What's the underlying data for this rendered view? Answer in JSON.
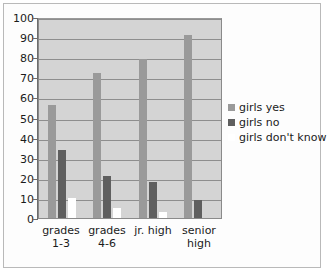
{
  "chart_data": {
    "type": "bar",
    "title": "",
    "subtitle": "",
    "xlabel": "",
    "ylabel": "",
    "categories": [
      "grades 1-3",
      "grades 4-6",
      "jr. high",
      "senior high"
    ],
    "category_lines": [
      [
        "grades",
        "1-3"
      ],
      [
        "grades",
        "4-6"
      ],
      [
        "jr. high",
        ""
      ],
      [
        "senior",
        "high"
      ]
    ],
    "series": [
      {
        "name": "girls yes",
        "color": "#9a9a9a",
        "values": [
          56,
          72,
          79,
          91
        ]
      },
      {
        "name": "girls no",
        "color": "#5f5f5f",
        "values": [
          34,
          21,
          18,
          9
        ]
      },
      {
        "name": "girls don't know",
        "color": "#ffffff",
        "values": [
          10,
          5,
          3,
          0
        ]
      }
    ],
    "ylim": [
      0,
      100
    ],
    "ytick_step": 10,
    "yticks": [
      0,
      10,
      20,
      30,
      40,
      50,
      60,
      70,
      80,
      90,
      100
    ],
    "ytick_labels": [
      "0",
      "10",
      "20",
      "30",
      "40",
      "50",
      "60",
      "70",
      "80",
      "90",
      "100"
    ],
    "grid": true,
    "grid_axis": "y",
    "legend_position": "right",
    "plot_background": "#d4d4d4",
    "figure_background": "#fdfdfd",
    "border_color": "#b9b9b9"
  },
  "legend": {
    "entries": [
      {
        "label": "girls yes",
        "color": "#9a9a9a"
      },
      {
        "label": "girls no",
        "color": "#5f5f5f"
      },
      {
        "label": "girls don't know",
        "color": "#ffffff"
      }
    ]
  }
}
